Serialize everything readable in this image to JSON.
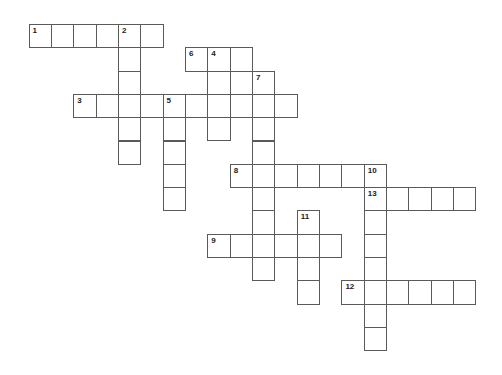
{
  "puzzle": {
    "type": "crossword",
    "colors": {
      "border": "#5a5a5a",
      "cell_fill": "#ffffff",
      "number": "#222222"
    },
    "words": [
      {
        "number": "1",
        "direction": "across",
        "row": 0,
        "col": 0,
        "length": 6
      },
      {
        "number": "2",
        "direction": "down",
        "row": 0,
        "col": 4,
        "length": 6
      },
      {
        "number": "6",
        "direction": "across",
        "row": 1,
        "col": 7,
        "length": 3
      },
      {
        "number": "4",
        "direction": "down",
        "row": 1,
        "col": 8,
        "length": 4
      },
      {
        "number": "7",
        "direction": "down",
        "row": 2,
        "col": 10,
        "length": 9
      },
      {
        "number": "3",
        "direction": "across",
        "row": 3,
        "col": 2,
        "length": 10
      },
      {
        "number": "5",
        "direction": "down",
        "row": 3,
        "col": 6,
        "length": 5
      },
      {
        "number": "8",
        "direction": "across",
        "row": 6,
        "col": 9,
        "length": 7
      },
      {
        "number": "10",
        "direction": "down",
        "row": 6,
        "col": 15,
        "length": 8
      },
      {
        "number": "13",
        "direction": "across",
        "row": 7,
        "col": 15,
        "length": 5
      },
      {
        "number": "11",
        "direction": "down",
        "row": 8,
        "col": 12,
        "length": 4
      },
      {
        "number": "9",
        "direction": "across",
        "row": 9,
        "col": 8,
        "length": 6
      },
      {
        "number": "12",
        "direction": "across",
        "row": 11,
        "col": 14,
        "length": 6
      }
    ]
  }
}
